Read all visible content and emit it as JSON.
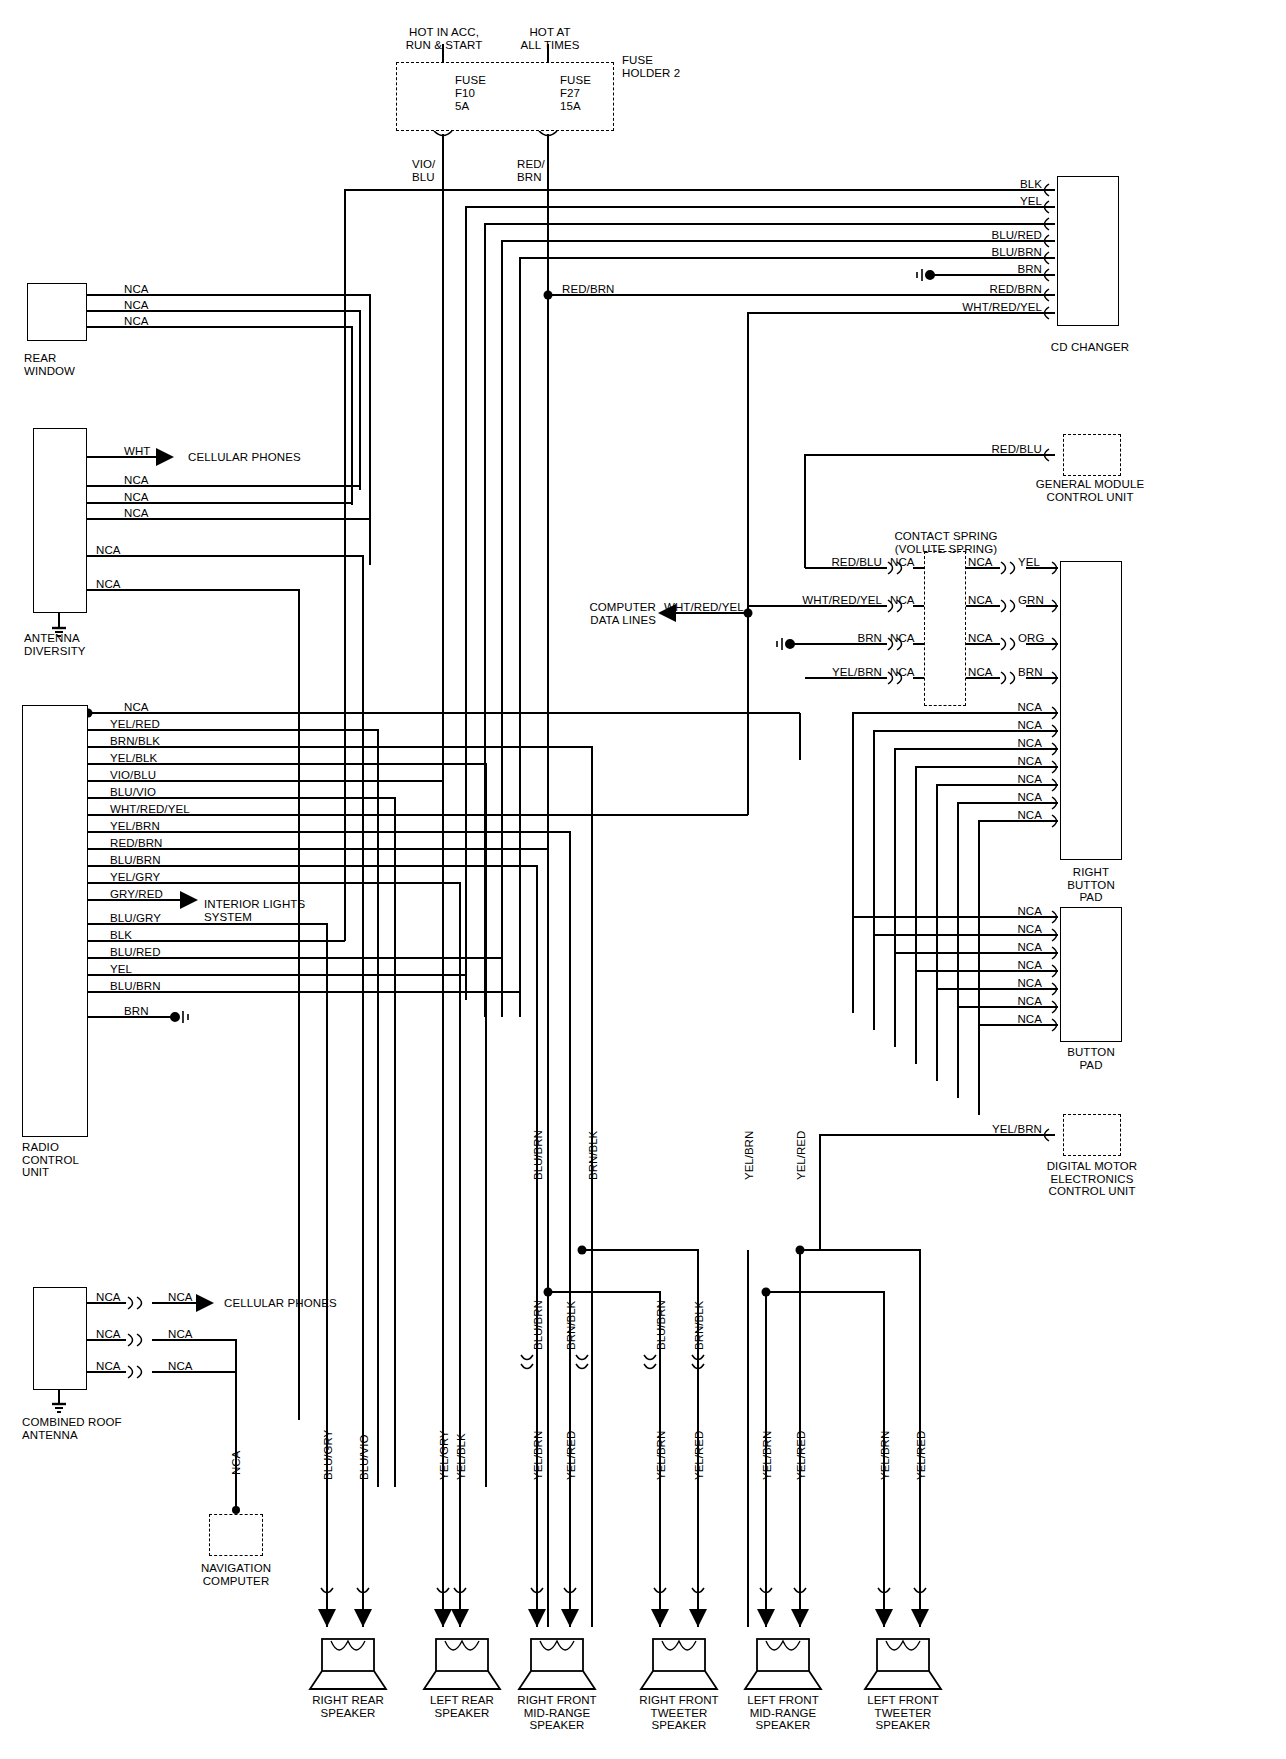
{
  "diagram": {
    "power_sources": [
      {
        "id": "acc",
        "label": "HOT IN ACC,\nRUN & START"
      },
      {
        "id": "bat",
        "label": "HOT AT\nALL TIMES"
      }
    ],
    "fuse_holder": {
      "label": "FUSE\nHOLDER 2"
    },
    "fuses": [
      {
        "name": "FUSE",
        "id": "F10",
        "rating": "5A",
        "out_wire": "VIO/\nBLU"
      },
      {
        "name": "FUSE",
        "id": "F27",
        "rating": "15A",
        "out_wire": "RED/\nBRN"
      }
    ],
    "components": [
      {
        "id": "rear-window",
        "label": "REAR\nWINDOW"
      },
      {
        "id": "antenna-diversity",
        "label": "ANTENNA\nDIVERSITY"
      },
      {
        "id": "radio-control-unit",
        "label": "RADIO\nCONTROL\nUNIT"
      },
      {
        "id": "combined-roof-antenna",
        "label": "COMBINED ROOF\nANTENNA"
      },
      {
        "id": "cd-changer",
        "label": "CD CHANGER"
      },
      {
        "id": "general-module-control-unit",
        "label": "GENERAL MODULE\nCONTROL UNIT"
      },
      {
        "id": "right-button-pad",
        "label": "RIGHT\nBUTTON\nPAD"
      },
      {
        "id": "button-pad",
        "label": "BUTTON\nPAD"
      },
      {
        "id": "digital-motor-electronics",
        "label": "DIGITAL MOTOR\nELECTRONICS\nCONTROL UNIT"
      },
      {
        "id": "navigation-computer",
        "label": "NAVIGATION\nCOMPUTER"
      },
      {
        "id": "contact-spring",
        "label": "CONTACT SPRING\n(VOLUTE SPRING)"
      }
    ],
    "destinations": [
      {
        "id": "cellular-phones-top",
        "label": "CELLULAR PHONES"
      },
      {
        "id": "cellular-phones-bottom",
        "label": "CELLULAR PHONES"
      },
      {
        "id": "interior-lights",
        "label": "INTERIOR LIGHTS\nSYSTEM"
      },
      {
        "id": "computer-data-lines",
        "label": "COMPUTER\nDATA LINES"
      }
    ],
    "rear_window_wires": [
      "NCA",
      "NCA",
      "NCA"
    ],
    "antenna_diversity_wires": [
      "WHT",
      "NCA",
      "NCA",
      "NCA",
      "NCA",
      "NCA"
    ],
    "radio_control_unit_wires": [
      "NCA",
      "YEL/RED",
      "BRN/BLK",
      "YEL/BLK",
      "VIO/BLU",
      "BLU/VIO",
      "WHT/RED/YEL",
      "YEL/BRN",
      "RED/BRN",
      "BLU/BRN",
      "YEL/GRY",
      "GRY/RED",
      "BLU/GRY",
      "BLK",
      "BLU/RED",
      "YEL",
      "BLU/BRN",
      "BRN"
    ],
    "combined_roof_antenna_wires": [
      {
        "left": "NCA",
        "right": "NCA"
      },
      {
        "left": "NCA",
        "right": "NCA"
      },
      {
        "left": "NCA",
        "right": "NCA"
      }
    ],
    "cd_changer_wires": [
      "BLK",
      "YEL",
      "",
      "BLU/RED",
      "BLU/BRN",
      "BRN",
      "RED/BRN",
      "WHT/RED/YEL"
    ],
    "general_module_wire": "RED/BLU",
    "contact_spring_rows": [
      {
        "left": "RED/BLU",
        "mid_left": "NCA",
        "mid_right": "NCA",
        "right": "YEL"
      },
      {
        "left": "WHT/RED/YEL",
        "mid_left": "NCA",
        "mid_right": "NCA",
        "right": "GRN"
      },
      {
        "left": "BRN",
        "mid_left": "NCA",
        "mid_right": "NCA",
        "right": "ORG"
      },
      {
        "left": "YEL/BRN",
        "mid_left": "NCA",
        "mid_right": "NCA",
        "right": "BRN"
      }
    ],
    "right_button_pad_wires": [
      "NCA",
      "NCA",
      "NCA",
      "NCA",
      "NCA",
      "NCA",
      "NCA"
    ],
    "button_pad_wires": [
      "NCA",
      "NCA",
      "NCA",
      "NCA",
      "NCA",
      "NCA",
      "NCA"
    ],
    "dme_wire": "YEL/BRN",
    "navigation_wire": "NCA",
    "mid_trunk_labels": [
      "BLU/BRN",
      "BRN/BLK",
      "YEL/BRN",
      "YEL/RED"
    ],
    "data_line_labels": {
      "left": "WHT/RED/YEL",
      "right": "WHT/RED/YEL",
      "red_brn": "RED/BRN"
    },
    "speakers": [
      {
        "id": "right-rear-speaker",
        "label": "RIGHT REAR\nSPEAKER",
        "wires": [
          "BLU/GRY",
          "BLU/VIO"
        ]
      },
      {
        "id": "left-rear-speaker",
        "label": "LEFT REAR\nSPEAKER",
        "wires": [
          "YEL/GRY",
          "YEL/BLK"
        ]
      },
      {
        "id": "right-front-mid-range-speaker",
        "label": "RIGHT FRONT\nMID-RANGE\nSPEAKER",
        "wires": [
          "YEL/BRN",
          "YEL/RED"
        ]
      },
      {
        "id": "right-front-tweeter-speaker",
        "label": "RIGHT FRONT\nTWEETER\nSPEAKER",
        "wires": [
          "YEL/BRN",
          "YEL/RED"
        ]
      },
      {
        "id": "left-front-mid-range-speaker",
        "label": "LEFT FRONT\nMID-RANGE\nSPEAKER",
        "wires": [
          "YEL/BRN",
          "YEL/RED"
        ]
      },
      {
        "id": "left-front-tweeter-speaker",
        "label": "LEFT FRONT\nTWEETER\nSPEAKER",
        "wires": [
          "YEL/BRN",
          "YEL/RED"
        ]
      }
    ],
    "speaker_branch_labels": [
      {
        "id": "rf-mid-top",
        "label": "BLU/BRN"
      },
      {
        "id": "rf-mid-top2",
        "label": "BRN/BLK"
      },
      {
        "id": "rf-tw-top",
        "label": "BLU/BRN"
      },
      {
        "id": "rf-tw-top2",
        "label": "BRN/BLK"
      },
      {
        "id": "lf-mid-top",
        "label": "YEL/BRN"
      },
      {
        "id": "lf-mid-top2",
        "label": "YEL/RED"
      }
    ]
  }
}
